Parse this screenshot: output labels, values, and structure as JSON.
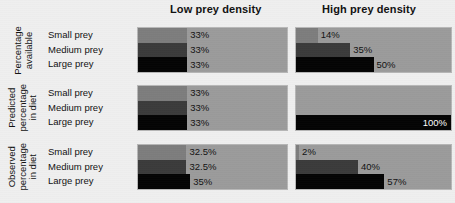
{
  "columns": [
    {
      "id": "low",
      "label": "Low prey density"
    },
    {
      "id": "high",
      "label": "High prey density"
    }
  ],
  "categories": [
    "Small prey",
    "Medium prey",
    "Large prey"
  ],
  "colors": {
    "panel_background": "#9b9b9b",
    "small_prey": "#7d7d7d",
    "medium_prey": "#3b3b3b",
    "large_prey": "#040404",
    "page_background": "#efefef",
    "text": "#111111",
    "inverse_text": "#ffffff"
  },
  "rows": [
    {
      "id": "percentage-available",
      "label_lines": [
        "Percentage",
        "available"
      ],
      "low": [
        {
          "category": "Small prey",
          "value": 33,
          "label": "33%",
          "inside": false
        },
        {
          "category": "Medium prey",
          "value": 33,
          "label": "33%",
          "inside": false
        },
        {
          "category": "Large prey",
          "value": 33,
          "label": "33%",
          "inside": false
        }
      ],
      "high": [
        {
          "category": "Small prey",
          "value": 14,
          "label": "14%",
          "inside": false
        },
        {
          "category": "Medium prey",
          "value": 35,
          "label": "35%",
          "inside": false
        },
        {
          "category": "Large prey",
          "value": 50,
          "label": "50%",
          "inside": false
        }
      ]
    },
    {
      "id": "predicted-percentage-in-diet",
      "label_lines": [
        "Predicted",
        "percentage",
        "in diet"
      ],
      "low": [
        {
          "category": "Small prey",
          "value": 33,
          "label": "33%",
          "inside": false
        },
        {
          "category": "Medium prey",
          "value": 33,
          "label": "33%",
          "inside": false
        },
        {
          "category": "Large prey",
          "value": 33,
          "label": "33%",
          "inside": false
        }
      ],
      "high": [
        {
          "category": "Small prey",
          "value": 0,
          "label": "",
          "inside": false
        },
        {
          "category": "Medium prey",
          "value": 0,
          "label": "",
          "inside": false
        },
        {
          "category": "Large prey",
          "value": 100,
          "label": "100%",
          "inside": true
        }
      ]
    },
    {
      "id": "observed-percentage-in-diet",
      "label_lines": [
        "Observed",
        "percentage",
        "in diet"
      ],
      "low": [
        {
          "category": "Small prey",
          "value": 32.5,
          "label": "32.5%",
          "inside": false
        },
        {
          "category": "Medium prey",
          "value": 32.5,
          "label": "32.5%",
          "inside": false
        },
        {
          "category": "Large prey",
          "value": 35,
          "label": "35%",
          "inside": false
        }
      ],
      "high": [
        {
          "category": "Small prey",
          "value": 2,
          "label": "2%",
          "inside": false
        },
        {
          "category": "Medium prey",
          "value": 40,
          "label": "40%",
          "inside": false
        },
        {
          "category": "Large prey",
          "value": 57,
          "label": "57%",
          "inside": false
        }
      ]
    }
  ],
  "chart_data": {
    "type": "bar",
    "title": "",
    "xlabel": "",
    "ylabel": "",
    "xlim": [
      0,
      100
    ],
    "grid": false,
    "legend": "none",
    "orientation": "horizontal",
    "units": "percent",
    "panel_columns": [
      "Low prey density",
      "High prey density"
    ],
    "panel_rows": [
      "Percentage available",
      "Predicted percentage in diet",
      "Observed percentage in diet"
    ],
    "categories": [
      "Small prey",
      "Medium prey",
      "Large prey"
    ],
    "panels": [
      {
        "row": "Percentage available",
        "column": "Low prey density",
        "values": [
          33,
          33,
          33
        ],
        "labels": [
          "33%",
          "33%",
          "33%"
        ]
      },
      {
        "row": "Percentage available",
        "column": "High prey density",
        "values": [
          14,
          35,
          50
        ],
        "labels": [
          "14%",
          "35%",
          "50%"
        ]
      },
      {
        "row": "Predicted percentage in diet",
        "column": "Low prey density",
        "values": [
          33,
          33,
          33
        ],
        "labels": [
          "33%",
          "33%",
          "33%"
        ]
      },
      {
        "row": "Predicted percentage in diet",
        "column": "High prey density",
        "values": [
          0,
          0,
          100
        ],
        "labels": [
          "",
          "",
          "100%"
        ]
      },
      {
        "row": "Observed percentage in diet",
        "column": "Low prey density",
        "values": [
          32.5,
          32.5,
          35
        ],
        "labels": [
          "32.5%",
          "32.5%",
          "35%"
        ]
      },
      {
        "row": "Observed percentage in diet",
        "column": "High prey density",
        "values": [
          2,
          40,
          57
        ],
        "labels": [
          "2%",
          "40%",
          "57%"
        ]
      }
    ]
  }
}
